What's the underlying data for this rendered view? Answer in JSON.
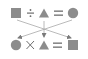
{
  "diagram": {
    "colors": {
      "shape_fill": "#8c8c8c",
      "operator": "#7a7a7a",
      "arrow": "#9a9a9a",
      "background": "#ffffff"
    },
    "top_row": [
      {
        "kind": "square",
        "label": "square"
      },
      {
        "kind": "operator",
        "symbol": "÷",
        "label": "divide"
      },
      {
        "kind": "triangle",
        "label": "triangle"
      },
      {
        "kind": "operator",
        "symbol": "=",
        "label": "equals"
      },
      {
        "kind": "circle",
        "label": "circle"
      }
    ],
    "bottom_row": [
      {
        "kind": "circle",
        "label": "circle"
      },
      {
        "kind": "operator",
        "symbol": "×",
        "label": "multiply"
      },
      {
        "kind": "triangle",
        "label": "triangle"
      },
      {
        "kind": "operator",
        "symbol": "=",
        "label": "equals"
      },
      {
        "kind": "square",
        "label": "square"
      }
    ],
    "arrows": [
      {
        "from": "top square",
        "to": "bottom square"
      },
      {
        "from": "top circle",
        "to": "bottom circle"
      },
      {
        "from": "top triangle",
        "to": "bottom triangle"
      }
    ]
  }
}
